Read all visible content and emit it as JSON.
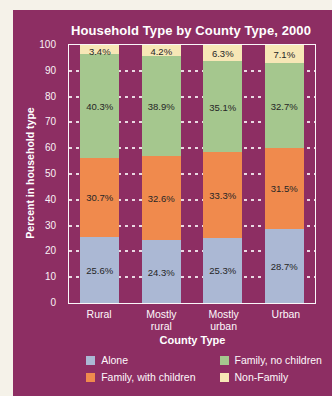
{
  "colors": {
    "page_background": "#f5f2e9",
    "card_background": "#8d2e63",
    "plot_frame": "#fbf6f9",
    "gridline": "#ffffff",
    "value_label_text": "#262626",
    "axis_text": "#ffffff"
  },
  "chart_data": {
    "type": "bar",
    "stacked": true,
    "title": "Household Type by County Type, 2000",
    "xlabel": "County Type",
    "ylabel": "Percent in household type",
    "categories": [
      "Rural",
      "Mostly\nrural",
      "Mostly\nurban",
      "Urban"
    ],
    "series": [
      {
        "name": "Alone",
        "color": "#abb8d4",
        "values": [
          25.6,
          24.3,
          25.3,
          28.7
        ]
      },
      {
        "name": "Family, with children",
        "color": "#f08a4d",
        "values": [
          30.7,
          32.6,
          33.3,
          31.5
        ]
      },
      {
        "name": "Family, no children",
        "color": "#a5c78e",
        "values": [
          40.3,
          38.9,
          35.1,
          32.7
        ]
      },
      {
        "name": "Non-Family",
        "color": "#f7e7b6",
        "values": [
          3.4,
          4.2,
          6.3,
          7.1
        ]
      }
    ],
    "ylim": [
      0,
      100
    ],
    "yticks": [
      0,
      10,
      20,
      30,
      40,
      50,
      60,
      70,
      80,
      90,
      100
    ],
    "grid": "dotted-horizontal",
    "legend_position": "bottom",
    "value_labels_shown": true
  }
}
